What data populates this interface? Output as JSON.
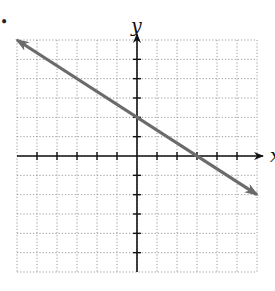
{
  "bullet": "•",
  "chart_data": {
    "type": "line",
    "title": "",
    "xlabel": "x",
    "ylabel": "y",
    "xlim": [
      -6,
      6
    ],
    "ylim": [
      -6,
      6
    ],
    "grid": true,
    "tick_step": 1,
    "tick_labels": false,
    "series": [
      {
        "name": "line",
        "equation": "y = -2/3 x + 2",
        "slope": -0.6667,
        "y_intercept": 2,
        "x_intercept": 3,
        "x": [
          -6,
          6
        ],
        "y": [
          6,
          -2
        ],
        "arrows": "both",
        "color": "#6b6b6b"
      }
    ]
  },
  "colors": {
    "axis": "#111111",
    "grid": "#9a9a9a",
    "line": "#6b6b6b"
  }
}
